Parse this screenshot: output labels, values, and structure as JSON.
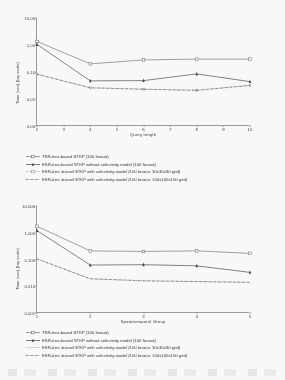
{
  "document": {
    "type": "scanned-figure-page",
    "figure_count": 2
  },
  "colors": {
    "axis": "#9a9a9a",
    "text": "#2f2f2f",
    "series_tsr": "#6e6e6e",
    "series_esr_noselect": "#3a3a3a",
    "series_esr_30grid": "#8a8a8a",
    "series_esr_100grid": "#4a4a4a",
    "page_background": "#fbfbfa"
  },
  "legend_labels": {
    "tsr": "TSR-tree-based STKP (100 fanout)",
    "esr_noselect": "ESR-tree-based STKP without selectivity model  (100 fanout)",
    "esr_30grid": "ESR-tree -based STKP with selectivity model  (100 fanout, 30x30x30 grid)",
    "esr_100grid": "ESR-tree -based STKP with selectivity model  (100 fanout, 100x100x100 grid)"
  },
  "chart_data": [
    {
      "id": "chart-query-length",
      "type": "line",
      "title": "",
      "xlabel": "Query length",
      "ylabel": "Time (sec) [log scale]",
      "xticks": [
        "2",
        "3",
        "4",
        "5",
        "6",
        "7",
        "8",
        "9",
        "10"
      ],
      "x": [
        2,
        4,
        6,
        8,
        10
      ],
      "yticks": [
        "10,00",
        "1,00",
        "0,10",
        "0,01",
        "0,00"
      ],
      "ytick_values": [
        10.0,
        1.0,
        0.1,
        0.01,
        0.001
      ],
      "ylim": [
        0.001,
        10.0
      ],
      "yscale": "log",
      "grid": false,
      "legend_position": "below",
      "series": [
        {
          "name": "TSR-tree-based STKP (100 fanout)",
          "marker": "open-square",
          "line": "solid",
          "color": "#6e6e6e",
          "values": [
            1.35,
            0.2,
            0.28,
            0.3,
            0.3
          ]
        },
        {
          "name": "ESR-tree-based STKP without selectivity model  (100 fanout)",
          "marker": "filled-triangle",
          "line": "solid",
          "color": "#3a3a3a",
          "values": [
            1.05,
            0.047,
            0.048,
            0.085,
            0.044
          ]
        },
        {
          "name": "ESR-tree -based STKP with selectivity model  (100 fanout, 30x30x30 grid)",
          "marker": "small-open-square",
          "line": "dotted",
          "color": "#8a8a8a",
          "values": [
            0.083,
            0.026,
            0.023,
            0.021,
            0.032
          ]
        },
        {
          "name": "ESR-tree -based STKP with selectivity model  (100 fanout, 100x100x100 grid)",
          "marker": "none",
          "line": "dash-dot",
          "color": "#4a4a4a",
          "values": [
            0.083,
            0.026,
            0.023,
            0.021,
            0.032
          ]
        }
      ]
    },
    {
      "id": "chart-spatiotemporal-group",
      "type": "line",
      "title": "",
      "xlabel": "Spatiotemporal Group",
      "ylabel": "Time (sec) [log scale]",
      "xticks": [
        "1",
        "2",
        "3",
        "4",
        "5"
      ],
      "x": [
        1,
        2,
        3,
        4,
        5
      ],
      "yticks": [
        "10,000",
        "1,000",
        "0,100",
        "0,010",
        "0,001"
      ],
      "ytick_values": [
        10.0,
        1.0,
        0.1,
        0.01,
        0.001
      ],
      "ylim": [
        0.001,
        10.0
      ],
      "yscale": "log",
      "grid": false,
      "legend_position": "below",
      "series": [
        {
          "name": "TSR-tree-based STKP (100 fanout)",
          "marker": "open-square",
          "line": "solid",
          "color": "#6e6e6e",
          "values": [
            1.75,
            0.21,
            0.2,
            0.21,
            0.17
          ]
        },
        {
          "name": "ESR-tree-based STKP without selectivity model  (100 fanout)",
          "marker": "filled-triangle",
          "line": "solid",
          "color": "#3a3a3a",
          "values": [
            1.2,
            0.062,
            0.064,
            0.058,
            0.033
          ]
        },
        {
          "name": "ESR-tree -based STKP with selectivity model  (100 fanout, 30x30x30 grid)",
          "marker": "none",
          "line": "dotted",
          "color": "#8a8a8a",
          "values": [
            0.105,
            0.019,
            0.016,
            0.015,
            0.014
          ]
        },
        {
          "name": "ESR-tree -based STKP with selectivity model  (100 fanout, 100x100x100 grid)",
          "marker": "none",
          "line": "dash-dot",
          "color": "#4a4a4a",
          "values": [
            0.105,
            0.019,
            0.016,
            0.015,
            0.014
          ]
        }
      ]
    }
  ]
}
